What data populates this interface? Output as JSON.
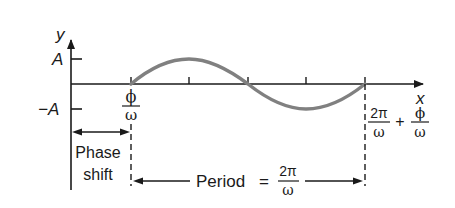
{
  "diagram": {
    "type": "sinusoid-graph",
    "axes": {
      "y_label": "y",
      "x_label": "x",
      "y_ticks": [
        {
          "label": "A",
          "value": "A"
        },
        {
          "label": "−A",
          "value": "-A"
        }
      ]
    },
    "curve": {
      "description": "One period of a sine wave shifted right by phase shift",
      "color": "#808080",
      "start_label": {
        "numerator": "ϕ",
        "denominator": "ω"
      },
      "end_label": {
        "term1": {
          "numerator": "2π",
          "denominator": "ω"
        },
        "operator": "+",
        "term2": {
          "numerator": "ϕ",
          "denominator": "ω"
        }
      },
      "interior_ticks": 3
    },
    "annotations": {
      "phase_shift": {
        "line1": "Phase",
        "line2": "shift"
      },
      "period": {
        "label": "Period",
        "equals": "=",
        "numerator": "2π",
        "denominator": "ω"
      }
    },
    "colors": {
      "axis": "#1a1a1a",
      "curve": "#808080"
    }
  }
}
